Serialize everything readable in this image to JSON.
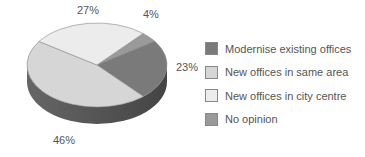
{
  "chart_data": {
    "type": "pie",
    "title": "",
    "categories": [
      "Modernise existing offices",
      "New offices in same area",
      "New offices in city centre",
      "No opinion"
    ],
    "values": [
      23,
      46,
      27,
      4
    ],
    "colors": [
      "#7a7a7a",
      "#d6d6d6",
      "#ececec",
      "#9a9a9a"
    ],
    "legend_position": "right",
    "style": "3d"
  },
  "labels": {
    "modernise": "23%",
    "same_area": "46%",
    "city_centre": "27%",
    "no_opinion": "4%"
  },
  "legend": [
    {
      "label": "Modernise existing offices",
      "color": "#7a7a7a"
    },
    {
      "label": "New offices in same area",
      "color": "#d6d6d6"
    },
    {
      "label": "New offices in city centre",
      "color": "#ececec"
    },
    {
      "label": "No opinion",
      "color": "#9a9a9a"
    }
  ]
}
